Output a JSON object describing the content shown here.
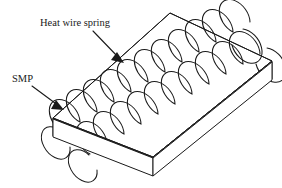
{
  "figure": {
    "type": "technical-line-diagram",
    "background_color": "#ffffff",
    "line_color": "#1a1a1a",
    "width": 282,
    "height": 188
  },
  "labels": [
    {
      "id": "heat-wire-spring",
      "text": "Heat wire spring",
      "x": 40,
      "y": 26,
      "leader": {
        "from_x": 93,
        "from_y": 31,
        "to_x": 121,
        "to_y": 60
      }
    },
    {
      "id": "smp",
      "text": "SMP",
      "x": 12,
      "y": 82,
      "leader": {
        "from_x": 32,
        "from_y": 86,
        "to_x": 61,
        "to_y": 108
      }
    }
  ],
  "slab": {
    "name": "SMP rectangular slab",
    "top_face": [
      {
        "x": 53,
        "y": 118
      },
      {
        "x": 170,
        "y": 13
      },
      {
        "x": 272,
        "y": 61
      },
      {
        "x": 153,
        "y": 157
      }
    ],
    "thickness": 18,
    "front_left_edge": [
      {
        "x": 53,
        "y": 118
      },
      {
        "x": 53,
        "y": 136
      }
    ],
    "front_bottom_edge": [
      {
        "x": 53,
        "y": 136
      },
      {
        "x": 153,
        "y": 175
      }
    ],
    "front_right_edge": [
      {
        "x": 153,
        "y": 157
      },
      {
        "x": 153,
        "y": 175
      }
    ],
    "right_bottom_edge": [
      {
        "x": 153,
        "y": 175
      },
      {
        "x": 272,
        "y": 79
      }
    ],
    "right_vertical_edge": [
      {
        "x": 272,
        "y": 61
      },
      {
        "x": 272,
        "y": 79
      }
    ]
  },
  "spring": {
    "name": "heat wire spring",
    "description": "two parallel helical coils forming a hairpin loop inside the slab",
    "coil_count": 2,
    "turns_per_coil": 12,
    "coil_a": {
      "start": {
        "x": 68,
        "y": 128
      },
      "end": {
        "x": 228,
        "y": 42
      },
      "radius_x": 13,
      "radius_y": 19
    },
    "coil_b": {
      "start": {
        "x": 96,
        "y": 150
      },
      "end": {
        "x": 252,
        "y": 62
      },
      "radius_x": 13,
      "radius_y": 19
    }
  }
}
